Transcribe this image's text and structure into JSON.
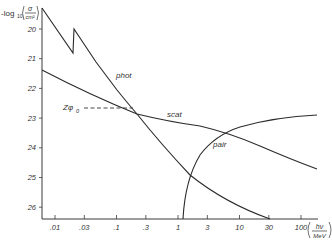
{
  "chart_data": {
    "type": "line",
    "title": "",
    "ylabel": "-log10(σ / cm²)",
    "ylabel_parts": {
      "prefix": "-log",
      "sub": "10",
      "num": "σ",
      "den": "cm²"
    },
    "xlabel": "hν / MeV",
    "xlabel_parts": {
      "num": "hν",
      "den": "MeV"
    },
    "x_scale": "log",
    "y_inverted": true,
    "xlim": [
      0.005,
      300
    ],
    "ylim": [
      19.3,
      26.4
    ],
    "grid": false,
    "x_ticks": [
      {
        "v": 0.01,
        "label": ".01"
      },
      {
        "v": 0.03,
        "label": ".03"
      },
      {
        "v": 0.1,
        "label": ".1"
      },
      {
        "v": 0.3,
        "label": ".3"
      },
      {
        "v": 1,
        "label": "1"
      },
      {
        "v": 3,
        "label": "3"
      },
      {
        "v": 10,
        "label": "10"
      },
      {
        "v": 30,
        "label": "30"
      },
      {
        "v": 100,
        "label": "100"
      }
    ],
    "y_ticks": [
      {
        "v": 20,
        "label": "20"
      },
      {
        "v": 21,
        "label": "21"
      },
      {
        "v": 22,
        "label": "22"
      },
      {
        "v": 23,
        "label": "23"
      },
      {
        "v": 24,
        "label": "24"
      },
      {
        "v": 25,
        "label": "25"
      },
      {
        "v": 26,
        "label": "26"
      }
    ],
    "series": [
      {
        "name": "phot",
        "points": [
          [
            0.0048,
            19.3
          ],
          [
            0.015,
            20.8
          ],
          [
            0.0155,
            20.0
          ],
          [
            0.05,
            21.3
          ],
          [
            0.1,
            22.0
          ],
          [
            0.2,
            22.55
          ],
          [
            0.3,
            22.95
          ],
          [
            1.0,
            24.3
          ],
          [
            3.0,
            25.3
          ],
          [
            10,
            26.0
          ],
          [
            30,
            26.35
          ]
        ]
      },
      {
        "name": "scat",
        "points": [
          [
            0.0048,
            21.4
          ],
          [
            0.03,
            22.1
          ],
          [
            0.1,
            22.55
          ],
          [
            0.3,
            22.85
          ],
          [
            1.0,
            23.05
          ],
          [
            3.0,
            23.25
          ],
          [
            10,
            23.65
          ],
          [
            30,
            24.2
          ],
          [
            100,
            24.75
          ],
          [
            160,
            25.0
          ]
        ]
      },
      {
        "name": "pair",
        "points": [
          [
            1.2,
            26.4
          ],
          [
            1.5,
            25.3
          ],
          [
            2,
            24.6
          ],
          [
            3,
            24.0
          ],
          [
            5,
            23.55
          ],
          [
            10,
            23.05
          ],
          [
            30,
            22.65
          ],
          [
            100,
            22.4
          ],
          [
            160,
            22.35
          ]
        ]
      }
    ],
    "annotations": [
      {
        "text": "phot",
        "near": "phot curve at hν≈0.25"
      },
      {
        "text": "scat",
        "near": "scat curve at hν≈2"
      },
      {
        "text": "pair",
        "near": "pair curve at hν≈3"
      },
      {
        "text": "Zφ0",
        "note": "dashed horizontal reference to scat at hν≈0.3, y≈22.7"
      }
    ]
  },
  "labels": {
    "phot": "phot",
    "scat": "scat",
    "pair": "pair",
    "zphi_main": "Zφ",
    "zphi_sub": "0",
    "y_prefix": "-log",
    "y_sub": "10",
    "y_num": "σ",
    "y_den": "cm²",
    "x_num": "hν",
    "x_den": "MeV"
  }
}
